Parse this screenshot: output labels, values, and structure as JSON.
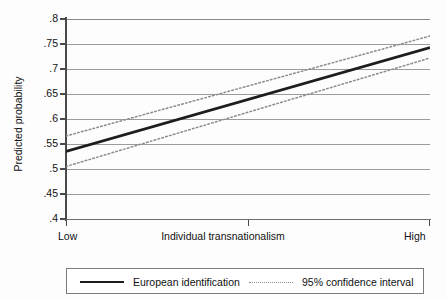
{
  "chart_data": {
    "type": "line",
    "title": "",
    "xlabel": "Individual transnationalism",
    "ylabel": "Predicted probability",
    "ylim": [
      0.4,
      0.8
    ],
    "yticks": [
      ".8",
      ".75",
      ".7",
      ".65",
      ".6",
      ".55",
      ".5",
      ".45",
      ".4"
    ],
    "ytick_values": [
      0.8,
      0.75,
      0.7,
      0.65,
      0.6,
      0.55,
      0.5,
      0.45,
      0.4
    ],
    "xticks": [
      "Low",
      "High"
    ],
    "xlim": [
      0,
      1
    ],
    "grid": true,
    "legend_position": "below",
    "series": [
      {
        "name": "European identification",
        "style": "solid",
        "color": "#1d1d1d",
        "x": [
          0,
          1
        ],
        "values": [
          0.535,
          0.743
        ]
      },
      {
        "name": "95% confidence interval",
        "style": "dotted",
        "color": "#8c8c8c",
        "bound": "upper",
        "x": [
          0,
          1
        ],
        "values": [
          0.566,
          0.766
        ]
      },
      {
        "name": "95% confidence interval",
        "style": "dotted",
        "color": "#8c8c8c",
        "bound": "lower",
        "x": [
          0,
          1
        ],
        "values": [
          0.505,
          0.722
        ]
      }
    ]
  },
  "axes": {
    "y_title": "Predicted probability",
    "x_title": "Individual transnationalism",
    "x_low_label": "Low",
    "x_high_label": "High",
    "y_tick_labels": [
      ".8",
      ".75",
      ".7",
      ".65",
      ".6",
      ".55",
      ".5",
      ".45",
      ".4"
    ]
  },
  "legend": {
    "items": [
      {
        "label": "European identification",
        "style": "solid"
      },
      {
        "label": "95% confidence interval",
        "style": "dotted"
      }
    ]
  },
  "colors": {
    "line": "#1d1d1d",
    "ci": "#8c8c8c",
    "grid": "#9b9b9b",
    "axis": "#4a4a4a",
    "background": "#fdfdfd"
  }
}
